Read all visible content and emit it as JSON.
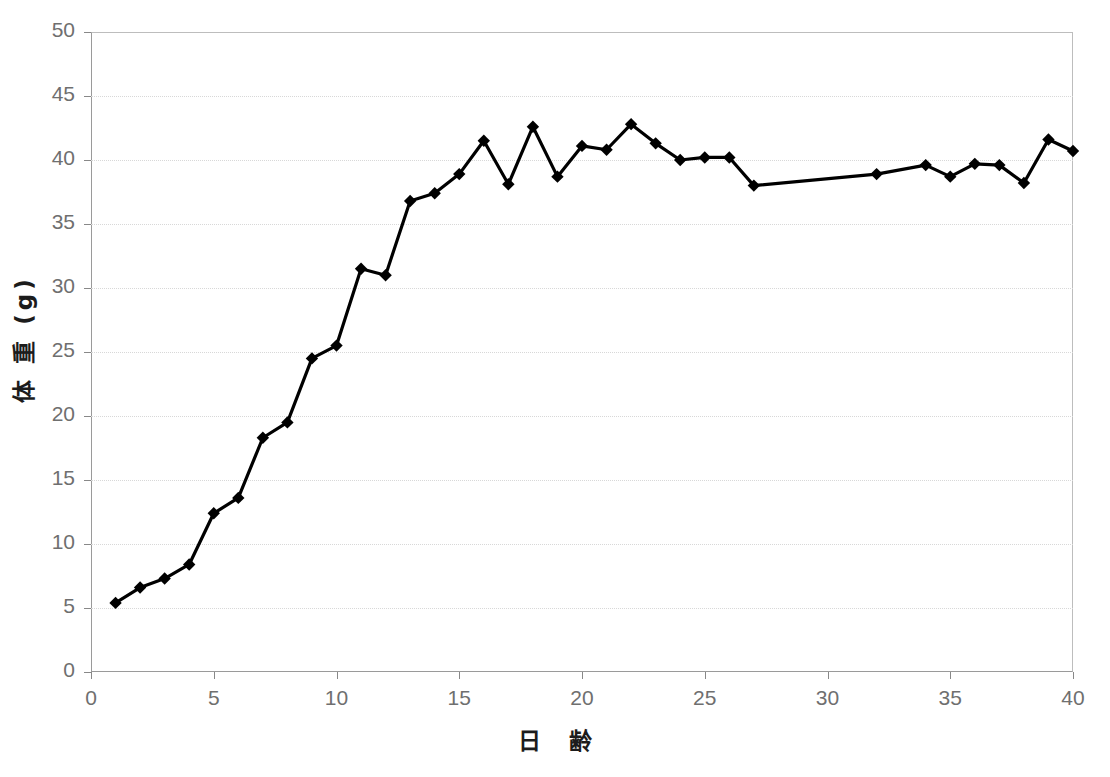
{
  "chart_data": {
    "type": "line",
    "title": "",
    "xlabel": "日 齢",
    "ylabel": "体 重 (g)",
    "xlim": [
      0,
      40
    ],
    "ylim": [
      0,
      50
    ],
    "xticks": [
      0,
      5,
      10,
      15,
      20,
      25,
      30,
      35,
      40
    ],
    "yticks": [
      0,
      5,
      10,
      15,
      20,
      25,
      30,
      35,
      40,
      45,
      50
    ],
    "grid": "horizontal-dotted",
    "legend": "none",
    "marker": "filled-diamond",
    "line_color": "#000000",
    "marker_color": "#000000",
    "grid_color": "#d8d8d8",
    "axis_color": "#9a9a9a",
    "x": [
      1,
      2,
      3,
      4,
      5,
      6,
      7,
      8,
      9,
      10,
      11,
      12,
      13,
      14,
      15,
      16,
      17,
      18,
      19,
      20,
      21,
      22,
      23,
      24,
      25,
      26,
      27,
      32,
      34,
      35,
      36,
      37,
      38,
      39,
      40
    ],
    "values": [
      5.4,
      6.6,
      7.3,
      8.4,
      12.4,
      13.6,
      18.3,
      19.5,
      24.5,
      25.5,
      31.5,
      31.0,
      36.8,
      37.4,
      38.9,
      41.5,
      38.1,
      42.6,
      38.7,
      41.1,
      40.8,
      42.8,
      41.3,
      40.0,
      40.2,
      40.2,
      38.0,
      38.1,
      38.9,
      39.6,
      38.7,
      39.7,
      39.6,
      38.2,
      41.6
    ],
    "series": [
      {
        "name": "体重",
        "points": [
          {
            "x": 1,
            "y": 5.4
          },
          {
            "x": 2,
            "y": 6.6
          },
          {
            "x": 3,
            "y": 7.3
          },
          {
            "x": 4,
            "y": 8.4
          },
          {
            "x": 5,
            "y": 12.4
          },
          {
            "x": 6,
            "y": 13.6
          },
          {
            "x": 7,
            "y": 18.3
          },
          {
            "x": 8,
            "y": 19.5
          },
          {
            "x": 9,
            "y": 24.5
          },
          {
            "x": 10,
            "y": 25.5
          },
          {
            "x": 11,
            "y": 31.5
          },
          {
            "x": 12,
            "y": 31.0
          },
          {
            "x": 13,
            "y": 36.8
          },
          {
            "x": 14,
            "y": 37.4
          },
          {
            "x": 15,
            "y": 38.9
          },
          {
            "x": 16,
            "y": 41.5
          },
          {
            "x": 17,
            "y": 38.1
          },
          {
            "x": 18,
            "y": 42.6
          },
          {
            "x": 19,
            "y": 38.7
          },
          {
            "x": 20,
            "y": 41.1
          },
          {
            "x": 21,
            "y": 40.8
          },
          {
            "x": 22,
            "y": 42.8
          },
          {
            "x": 23,
            "y": 41.3
          },
          {
            "x": 24,
            "y": 40.0
          },
          {
            "x": 25,
            "y": 40.2
          },
          {
            "x": 26,
            "y": 40.2
          },
          {
            "x": 27,
            "y": 38.0
          },
          {
            "x": 32,
            "y": 38.9
          },
          {
            "x": 34,
            "y": 39.6
          },
          {
            "x": 35,
            "y": 38.7
          },
          {
            "x": 36,
            "y": 39.7
          },
          {
            "x": 37,
            "y": 39.6
          },
          {
            "x": 38,
            "y": 38.2
          },
          {
            "x": 39,
            "y": 41.6
          },
          {
            "x": 40,
            "y": 40.7
          }
        ]
      }
    ]
  }
}
